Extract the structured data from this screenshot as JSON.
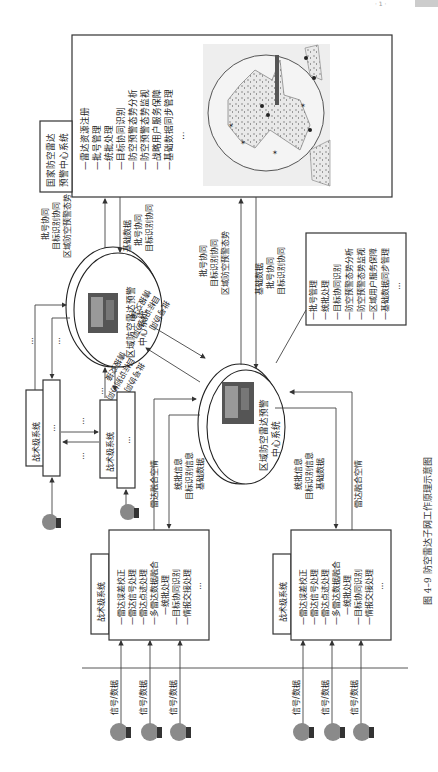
{
  "page_header": {
    "text": "· 1 ·",
    "badge": ""
  },
  "caption": "图 4–9   防空雷达子网工作原理示意图",
  "national_center": {
    "title_lines": [
      "国家防空雷达",
      "预警中心系统"
    ],
    "functions": [
      "—雷达资源注册",
      "—批号管理",
      "—统批处理",
      "—目标协同识别",
      "—防空预警态势分析",
      "—防空预警态势监视",
      "—战略用户服务保障",
      "—基础数据同步管理",
      "…"
    ],
    "map_label": "radar-coverage-map"
  },
  "regional_center_a": {
    "title_lines": [
      "区域防空雷达预警",
      "中心系统"
    ]
  },
  "regional_center_b": {
    "title_lines": [
      "区域防空雷达预警",
      "中心系统"
    ],
    "functions": [
      "—批号管理",
      "—统批处理",
      "—目标协同识别",
      "—防空预警态势分析",
      "—防空预警态势监视",
      "—区域用户服务保障",
      "—基础数据同步管理",
      "…"
    ]
  },
  "links": {
    "a_to_national_up": [
      "批号协同",
      "目标识别协同",
      "区域防空预警态势"
    ],
    "national_to_a_down": [
      "基础数据",
      "批号协同",
      "目标识别协同"
    ],
    "b_to_national_up": [
      "批号协同",
      "目标识别协同",
      "区域防空预警态势"
    ],
    "national_to_b_down": [
      "基础数据",
      "批号协同",
      "目标识别协同"
    ],
    "a_to_b": [
      "批号协同",
      "目标识别协同",
      "情报交接"
    ],
    "b_to_a": [
      "批号协同",
      "目标识别协同",
      "情报交接"
    ],
    "tactical_to_b_left": [
      "雷达融合空情"
    ],
    "b_to_tactical_left": [
      "统批信息",
      "目标识别信息",
      "基础数据"
    ],
    "b_to_tactical_right": [
      "统批信息",
      "目标识别信息",
      "基础数据"
    ],
    "tactical_to_b_right": [
      "雷达融合空情"
    ],
    "ellipsis": "…"
  },
  "tactical_small": [
    {
      "title": "战术级系统",
      "body": "…"
    },
    {
      "title": "战术级系统",
      "body": "…"
    }
  ],
  "tactical_large": [
    {
      "title": "战术级系统",
      "functions": [
        "—雷达误差校正",
        "—雷达信号处理",
        "—雷达点迹处理",
        "—多雷达数据融合",
        "—统批处理",
        "—目标协同识别",
        "—情报交接处理",
        "…"
      ]
    },
    {
      "title": "战术级系统",
      "functions": [
        "—雷达误差校正",
        "—雷达信号处理",
        "—雷达点迹处理",
        "—多雷达数据融合",
        "—统批处理",
        "—目标协同识别",
        "—情报交接处理",
        "…"
      ]
    }
  ],
  "signal_label": "信号/数据",
  "signal_inputs": [
    "信号/数据",
    "信号/数据",
    "信号/数据",
    "信号/数据",
    "信号/数据",
    "信号/数据"
  ]
}
